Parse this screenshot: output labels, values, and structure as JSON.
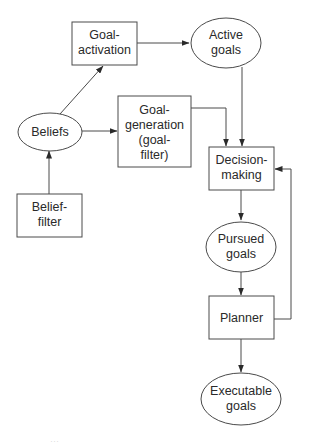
{
  "diagram": {
    "type": "flowchart",
    "colors": {
      "stroke": "#4a4a4a",
      "text": "#2a2a2a",
      "background": "#ffffff"
    },
    "nodes": {
      "goal_activation": {
        "shape": "rectangle",
        "lines": [
          "Goal-",
          "activation"
        ]
      },
      "active_goals": {
        "shape": "ellipse",
        "lines": [
          "Active",
          "goals"
        ]
      },
      "beliefs": {
        "shape": "ellipse",
        "lines": [
          "Beliefs"
        ]
      },
      "goal_generation": {
        "shape": "rectangle",
        "lines": [
          "Goal-",
          "generation",
          "(goal-",
          "filter)"
        ]
      },
      "belief_filter": {
        "shape": "rectangle",
        "lines": [
          "Belief-",
          "filter"
        ]
      },
      "decision_making": {
        "shape": "rectangle",
        "lines": [
          "Decision-",
          "making"
        ]
      },
      "pursued_goals": {
        "shape": "ellipse",
        "lines": [
          "Pursued",
          "goals"
        ]
      },
      "planner": {
        "shape": "rectangle",
        "lines": [
          "Planner"
        ]
      },
      "executable_goals": {
        "shape": "ellipse",
        "lines": [
          "Executable",
          "goals"
        ]
      }
    },
    "edges": [
      {
        "from": "Belief-filter",
        "to": "Beliefs"
      },
      {
        "from": "Beliefs",
        "to": "Goal-activation"
      },
      {
        "from": "Beliefs",
        "to": "Goal-generation (goal-filter)"
      },
      {
        "from": "Goal-activation",
        "to": "Active goals"
      },
      {
        "from": "Active goals",
        "to": "Decision-making"
      },
      {
        "from": "Goal-generation (goal-filter)",
        "to": "Decision-making"
      },
      {
        "from": "Decision-making",
        "to": "Pursued goals"
      },
      {
        "from": "Pursued goals",
        "to": "Planner"
      },
      {
        "from": "Planner",
        "to": "Executable goals"
      },
      {
        "from": "Planner",
        "to": "Decision-making",
        "kind": "feedback"
      }
    ],
    "caption": "…"
  }
}
